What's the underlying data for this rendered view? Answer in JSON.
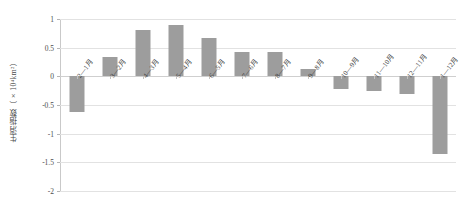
{
  "chart_data": {
    "type": "bar",
    "title": "",
    "subtitle": "",
    "xlabel": "",
    "ylabel": "生消指数（×10⁴km²）",
    "categories": [
      "2—1月",
      "3—2月",
      "4—3月",
      "5—4月",
      "6—5月",
      "7—6月",
      "8—7月",
      "9—8月",
      "10—9月",
      "11—10月",
      "12—11月",
      "1—12月"
    ],
    "values": [
      -0.63,
      0.33,
      0.8,
      0.89,
      0.66,
      0.43,
      0.43,
      0.12,
      -0.22,
      -0.26,
      -0.3,
      -1.35
    ],
    "ylim": [
      -2,
      1
    ],
    "yticks": [
      1,
      0.5,
      0,
      -0.5,
      -1,
      -1.5,
      -2
    ],
    "ytick_labels": [
      "1",
      "0.5",
      "0",
      "-0.5",
      "-1",
      "-1.5",
      "-2"
    ],
    "grid": true,
    "legend": false,
    "legend_position": "none",
    "series": [
      {
        "name": "生消指数",
        "values": [
          -0.63,
          0.33,
          0.8,
          0.89,
          0.66,
          0.43,
          0.43,
          0.12,
          -0.22,
          -0.26,
          -0.3,
          -1.35
        ]
      }
    ],
    "colors": {
      "bar": "#9d9d9d",
      "grid": "#e2e2e2",
      "axis": "#c9c9c9",
      "text": "#3f3f3f",
      "background": "#ffffff"
    }
  }
}
